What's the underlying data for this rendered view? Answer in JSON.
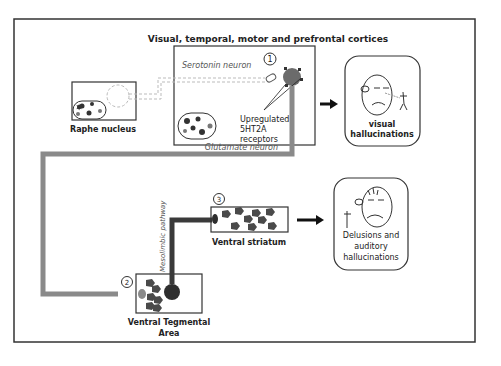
{
  "title": "Visual, temporal, motor and prefrontal cortices",
  "regions": {
    "raphe": {
      "label": "Raphe nucleus"
    },
    "cortex": {
      "marker": "1",
      "receptor_label_lines": [
        "Upregulated",
        "5HT2A",
        "receptors"
      ]
    },
    "vta": {
      "marker": "2",
      "label_lines": [
        "Ventral Tegmental",
        "Area"
      ]
    },
    "striatum": {
      "marker": "3",
      "label": "Ventral striatum"
    }
  },
  "pathways": {
    "serotonin": "Serotonin neuron",
    "glutamate": "Glutamate neuron",
    "mesolimbic": "Mesolimbic pathway"
  },
  "outcomes": {
    "visual": {
      "label_lines": [
        "visual",
        "hallucinations"
      ]
    },
    "delusions": {
      "label_lines": [
        "Delusions and",
        "auditory",
        "hallucinations"
      ]
    }
  },
  "colors": {
    "frame": "#333333",
    "glutamate_line": "#8a8a8a",
    "dopamine_line": "#3a3a3a",
    "serotonin_dash": "#b8b8b8",
    "neuron_gray": "#6b6b6b",
    "neuron_dark": "#2e2e2e"
  }
}
